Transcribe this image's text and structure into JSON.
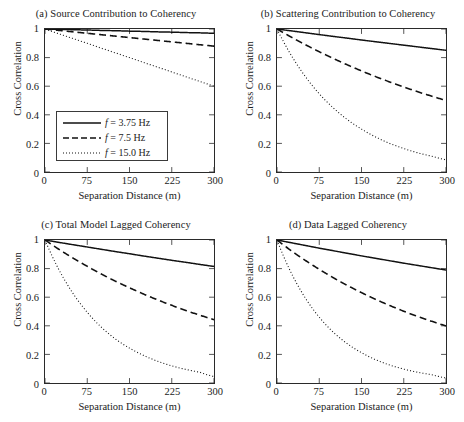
{
  "figure": {
    "axis_labels": {
      "x": "Separation Distance (m)",
      "y": "Cross Correlation"
    },
    "xticks": [
      "0",
      "75",
      "150",
      "225",
      "300"
    ],
    "yticks": [
      "0",
      "0.2",
      "0.4",
      "0.6",
      "0.8",
      "1"
    ]
  },
  "legend": {
    "entries": [
      {
        "style": "solid",
        "prefix": "f",
        "text": " = 3.75 Hz"
      },
      {
        "style": "dashed",
        "prefix": "f",
        "text": " = 7.5 Hz"
      },
      {
        "style": "dotted",
        "prefix": "f",
        "text": " = 15.0 Hz"
      }
    ]
  },
  "chart_data": [
    {
      "type": "line",
      "panel": "a",
      "title": "(a) Source Contribution to Coherency",
      "xlabel": "Separation Distance (m)",
      "ylabel": "Cross Correlation",
      "xlim": [
        0,
        300
      ],
      "ylim": [
        0,
        1
      ],
      "xticks": [
        0,
        75,
        150,
        225,
        300
      ],
      "yticks": [
        0,
        0.2,
        0.4,
        0.6,
        0.8,
        1
      ],
      "grid": false,
      "legend_position": "lower-left",
      "x": [
        0,
        25,
        50,
        75,
        100,
        125,
        150,
        175,
        200,
        225,
        250,
        275,
        300
      ],
      "series": [
        {
          "name": "f = 3.75 Hz",
          "style": "solid",
          "values": [
            1.0,
            0.998,
            0.995,
            0.993,
            0.99,
            0.988,
            0.985,
            0.983,
            0.98,
            0.978,
            0.975,
            0.973,
            0.97
          ]
        },
        {
          "name": "f = 7.5 Hz",
          "style": "dashed",
          "values": [
            1.0,
            0.99,
            0.98,
            0.97,
            0.96,
            0.95,
            0.94,
            0.93,
            0.92,
            0.91,
            0.9,
            0.89,
            0.88
          ]
        },
        {
          "name": "f = 15.0 Hz",
          "style": "dotted",
          "values": [
            1.0,
            0.966,
            0.933,
            0.9,
            0.866,
            0.833,
            0.8,
            0.766,
            0.733,
            0.7,
            0.666,
            0.633,
            0.6
          ]
        }
      ]
    },
    {
      "type": "line",
      "panel": "b",
      "title": "(b) Scattering Contribution to Coherency",
      "xlabel": "Separation Distance (m)",
      "ylabel": "Cross Correlation",
      "xlim": [
        0,
        300
      ],
      "ylim": [
        0,
        1
      ],
      "xticks": [
        0,
        75,
        150,
        225,
        300
      ],
      "yticks": [
        0,
        0.2,
        0.4,
        0.6,
        0.8,
        1
      ],
      "grid": false,
      "x": [
        0,
        25,
        50,
        75,
        100,
        125,
        150,
        175,
        200,
        225,
        250,
        275,
        300
      ],
      "series": [
        {
          "name": "f = 3.75 Hz",
          "style": "solid",
          "values": [
            1.0,
            0.987,
            0.974,
            0.961,
            0.948,
            0.936,
            0.923,
            0.911,
            0.899,
            0.887,
            0.875,
            0.863,
            0.851
          ]
        },
        {
          "name": "f = 7.5 Hz",
          "style": "dashed",
          "values": [
            1.0,
            0.944,
            0.891,
            0.841,
            0.794,
            0.749,
            0.707,
            0.667,
            0.63,
            0.595,
            0.561,
            0.53,
            0.5
          ]
        },
        {
          "name": "f = 15.0 Hz",
          "style": "dotted",
          "values": [
            1.0,
            0.818,
            0.669,
            0.547,
            0.448,
            0.366,
            0.3,
            0.245,
            0.2,
            0.164,
            0.134,
            0.11,
            0.085
          ]
        }
      ]
    },
    {
      "type": "line",
      "panel": "c",
      "title": "(c) Total Model Lagged Coherency",
      "xlabel": "Separation Distance (m)",
      "ylabel": "Cross Correlation",
      "xlim": [
        0,
        300
      ],
      "ylim": [
        0,
        1
      ],
      "xticks": [
        0,
        75,
        150,
        225,
        300
      ],
      "yticks": [
        0,
        0.2,
        0.4,
        0.6,
        0.8,
        1
      ],
      "grid": false,
      "x": [
        0,
        25,
        50,
        75,
        100,
        125,
        150,
        175,
        200,
        225,
        250,
        275,
        300
      ],
      "series": [
        {
          "name": "f = 3.75 Hz",
          "style": "solid",
          "values": [
            1.0,
            0.983,
            0.967,
            0.951,
            0.935,
            0.919,
            0.904,
            0.888,
            0.873,
            0.858,
            0.844,
            0.829,
            0.815
          ]
        },
        {
          "name": "f = 7.5 Hz",
          "style": "dashed",
          "values": [
            1.0,
            0.934,
            0.873,
            0.816,
            0.762,
            0.712,
            0.666,
            0.622,
            0.581,
            0.543,
            0.507,
            0.474,
            0.443
          ]
        },
        {
          "name": "f = 15.0 Hz",
          "style": "dotted",
          "values": [
            1.0,
            0.79,
            0.625,
            0.494,
            0.39,
            0.308,
            0.244,
            0.193,
            0.152,
            0.12,
            0.095,
            0.075,
            0.045
          ]
        }
      ]
    },
    {
      "type": "line",
      "panel": "d",
      "title": "(d) Data Lagged Coherency",
      "xlabel": "Separation Distance (m)",
      "ylabel": "Cross Correlation",
      "xlim": [
        0,
        300
      ],
      "ylim": [
        0,
        1
      ],
      "xticks": [
        0,
        75,
        150,
        225,
        300
      ],
      "yticks": [
        0,
        0.2,
        0.4,
        0.6,
        0.8,
        1
      ],
      "grid": false,
      "x": [
        0,
        25,
        50,
        75,
        100,
        125,
        150,
        175,
        200,
        225,
        250,
        275,
        300
      ],
      "series": [
        {
          "name": "f = 3.75 Hz",
          "style": "solid",
          "values": [
            1.0,
            0.981,
            0.962,
            0.943,
            0.925,
            0.907,
            0.889,
            0.872,
            0.855,
            0.838,
            0.822,
            0.806,
            0.79
          ]
        },
        {
          "name": "f = 7.5 Hz",
          "style": "dashed",
          "values": [
            1.0,
            0.926,
            0.858,
            0.795,
            0.736,
            0.682,
            0.632,
            0.585,
            0.542,
            0.502,
            0.465,
            0.431,
            0.399
          ]
        },
        {
          "name": "f = 15.0 Hz",
          "style": "dotted",
          "values": [
            1.0,
            0.772,
            0.596,
            0.46,
            0.355,
            0.274,
            0.212,
            0.163,
            0.126,
            0.097,
            0.075,
            0.058,
            0.035
          ]
        }
      ]
    }
  ]
}
